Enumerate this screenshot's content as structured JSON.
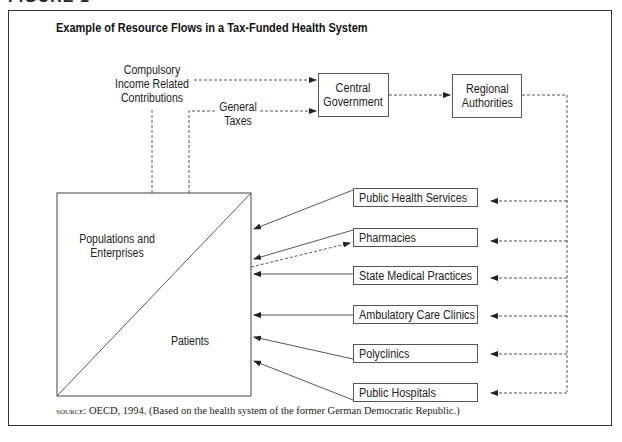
{
  "figure_label": "FIGURE 1",
  "title": "Example of Resource Flows in a Tax-Funded Health System",
  "sources": {
    "compulsory": [
      "Compulsory",
      "Income Related",
      "Contributions"
    ],
    "general_taxes": [
      "General",
      "Taxes"
    ]
  },
  "nodes": {
    "central_government": [
      "Central",
      "Government"
    ],
    "regional_authorities": [
      "Regional",
      "Authorities"
    ],
    "populations": [
      "Populations and",
      "Enterprises"
    ],
    "patients": "Patients"
  },
  "providers": [
    {
      "label": "Public Health Services"
    },
    {
      "label": "Pharmacies"
    },
    {
      "label": "State Medical Practices"
    },
    {
      "label": "Ambulatory Care Clinics"
    },
    {
      "label": "Polyclinics"
    },
    {
      "label": "Public Hospitals"
    }
  ],
  "source_note": {
    "prefix": "SOURCE:",
    "text": " OECD, 1994. (Based on the health system of the former German Democratic Republic.)"
  }
}
